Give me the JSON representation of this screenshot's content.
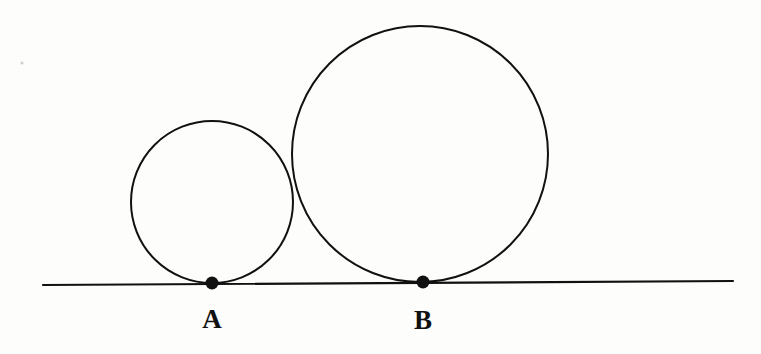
{
  "figure": {
    "background_color": "#fdfdfc",
    "stroke_color": "#111111",
    "width": 761,
    "height": 354
  },
  "labels": {
    "point_a": "A",
    "point_b": "B"
  },
  "chart_data": {
    "type": "diagram",
    "xlabel": "",
    "ylabel": "",
    "grid": false,
    "legend": false,
    "coordinate_system": "image pixels, origin top-left",
    "xlim": [
      0,
      761
    ],
    "ylim": [
      0,
      354
    ],
    "elements": [
      {
        "kind": "line",
        "name": "tangent-line",
        "x1": 43,
        "y1": 285,
        "x2": 733,
        "y2": 281,
        "stroke": "#111111",
        "stroke_width": 2.2
      },
      {
        "kind": "circle",
        "name": "small-circle",
        "cx": 212,
        "cy": 202,
        "r": 81,
        "stroke": "#111111",
        "stroke_width": 2.0,
        "fill": "none",
        "tangent_point": "A"
      },
      {
        "kind": "circle",
        "name": "large-circle",
        "cx": 420,
        "cy": 154,
        "r": 128,
        "stroke": "#111111",
        "stroke_width": 2.0,
        "fill": "none",
        "tangent_point": "B"
      },
      {
        "kind": "point",
        "name": "point-a-dot",
        "cx": 212,
        "cy": 283,
        "r": 6.5,
        "fill": "#111111",
        "label": "A"
      },
      {
        "kind": "point",
        "name": "point-b-dot",
        "cx": 423,
        "cy": 282,
        "r": 6.5,
        "fill": "#111111",
        "label": "B"
      },
      {
        "kind": "speck",
        "name": "scan-artifact-speck",
        "cx": 22,
        "cy": 63,
        "r": 1.6,
        "fill": "#cfcfcf"
      }
    ],
    "label_positions": [
      {
        "text": "A",
        "x": 212,
        "y": 306
      },
      {
        "text": "B",
        "x": 423,
        "y": 307
      }
    ]
  }
}
